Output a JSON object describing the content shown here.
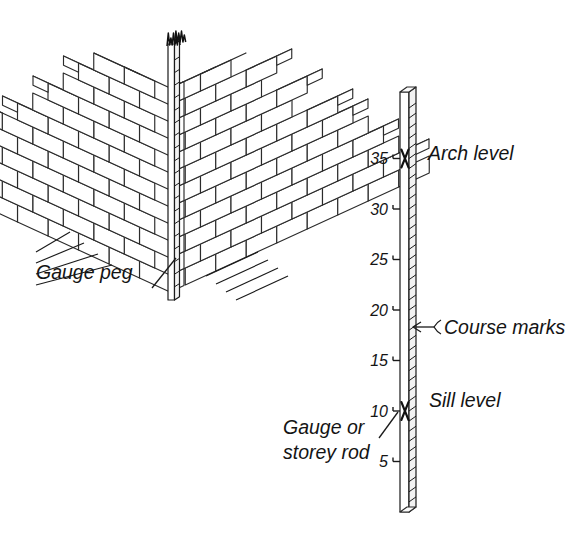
{
  "figure": {
    "background_color": "#ffffff",
    "line_color": "#1a1a1a"
  },
  "annotations": {
    "gauge_peg": "Gauge peg",
    "arch_level": "Arch level",
    "course_marks": "Course marks",
    "sill_level": "Sill level",
    "gauge_rod_line1": "Gauge or",
    "gauge_rod_line2": "storey rod"
  },
  "rod": {
    "tick_labels": [
      "35",
      "30",
      "25",
      "20",
      "15",
      "10",
      "5"
    ],
    "tick_values": [
      35,
      30,
      25,
      20,
      15,
      10,
      5
    ],
    "total_courses": 40,
    "marked_levels": [
      {
        "label": "Arch level",
        "course": 35
      },
      {
        "label": "Sill level",
        "course": 10
      }
    ]
  },
  "brickwork": {
    "description": "isometric brick quoin corner, racking back",
    "left_wall_courses": 12,
    "right_wall_courses": 12
  }
}
